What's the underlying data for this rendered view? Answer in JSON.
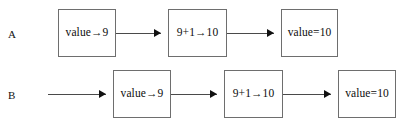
{
  "diagram": {
    "type": "flowchart",
    "title": "",
    "rows": [
      {
        "label": "A",
        "leading_arrow": false,
        "nodes": [
          {
            "text": "value→9"
          },
          {
            "text": "9+1→10"
          },
          {
            "text": "value=10"
          }
        ]
      },
      {
        "label": "B",
        "leading_arrow": true,
        "nodes": [
          {
            "text": "value→9"
          },
          {
            "text": "9+1→10"
          },
          {
            "text": "value=10"
          }
        ]
      }
    ],
    "colors": {
      "background": "#ffffff",
      "box_border": "#6e6e6e",
      "box_fill": "#ffffff",
      "text": "#0d0d0d",
      "connector": "#4a4a4a",
      "arrowhead": "#111111"
    }
  },
  "geometry": {
    "rowA": {
      "label_x": 8,
      "label_y": 29,
      "box_top": 9,
      "box_height": 48,
      "line_y": 33,
      "boxes": [
        {
          "x": 58,
          "width": 58
        },
        {
          "x": 168,
          "width": 59
        },
        {
          "x": 281,
          "width": 57
        }
      ],
      "connectors": [
        {
          "x": 116,
          "width": 45
        },
        {
          "x": 227,
          "width": 47
        }
      ],
      "arrowheads": [
        {
          "x": 154
        },
        {
          "x": 267
        }
      ],
      "leading": null
    },
    "rowB": {
      "label_x": 8,
      "label_y": 90,
      "box_top": 70,
      "box_height": 48,
      "line_y": 94,
      "boxes": [
        {
          "x": 113,
          "width": 58
        },
        {
          "x": 224,
          "width": 59
        },
        {
          "x": 338,
          "width": 58
        }
      ],
      "connectors": [
        {
          "x": 171,
          "width": 46
        },
        {
          "x": 283,
          "width": 48
        }
      ],
      "arrowheads": [
        {
          "x": 210
        },
        {
          "x": 324
        }
      ],
      "leading": {
        "x": 48,
        "width": 58,
        "arrow_x": 99
      }
    }
  }
}
